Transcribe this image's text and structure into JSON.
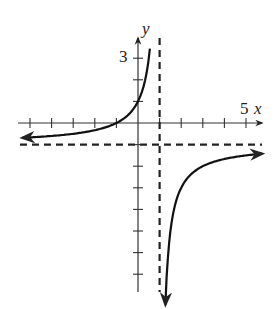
{
  "chart_data": {
    "type": "line",
    "title": "",
    "xlabel": "x",
    "ylabel": "y",
    "xlim": [
      -5.5,
      5.8
    ],
    "ylim": [
      -7.8,
      4.2
    ],
    "x_tick_step": 1,
    "y_tick_step": 1,
    "labeled_ticks": {
      "x": [
        {
          "value": 5,
          "label": "5"
        }
      ],
      "y": [
        {
          "value": 3,
          "label": "3"
        }
      ]
    },
    "grid": false,
    "asymptotes": {
      "vertical": [
        1
      ],
      "horizontal": [
        -1
      ]
    },
    "function": "y = -1 - 2/(x - 1)",
    "series": [
      {
        "name": "left branch",
        "x": [
          -5.4,
          -4,
          -3,
          -2,
          -1,
          0,
          0.3,
          0.45
        ],
        "y": [
          -0.69,
          -0.6,
          -0.5,
          -0.33,
          0,
          1,
          1.86,
          2.64
        ]
      },
      {
        "name": "right branch",
        "x": [
          1.25,
          1.5,
          2,
          3,
          4,
          5,
          5.8
        ],
        "y": [
          -9,
          -5,
          -3,
          -2,
          -1.67,
          -1.5,
          -1.42
        ]
      }
    ]
  },
  "labels": {
    "x_axis": "x",
    "y_axis": "y",
    "x_tick_5": "5",
    "y_tick_3": "3"
  }
}
